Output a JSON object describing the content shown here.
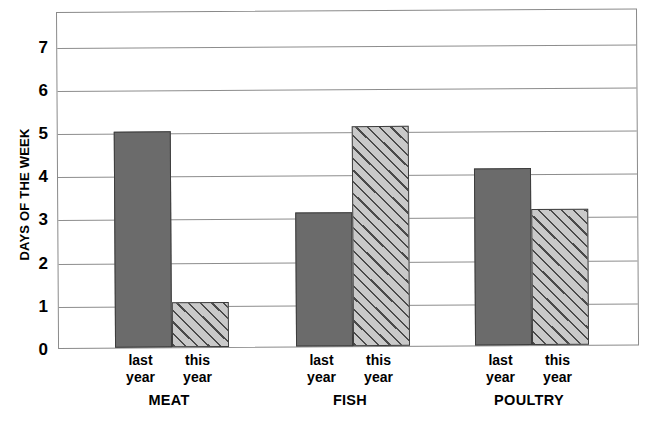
{
  "chart_data": {
    "type": "bar",
    "title": "",
    "subtitle": "",
    "xlabel": "",
    "ylabel": "DAYS OF THE WEEK",
    "ylim": [
      0,
      7.8
    ],
    "yticks": [
      0,
      1,
      2,
      3,
      4,
      5,
      6,
      7
    ],
    "ytick_labels": [
      "0",
      "1",
      "2",
      "3",
      "4",
      "5",
      "6",
      "7"
    ],
    "grid": true,
    "legend": "none",
    "categories": [
      "MEAT",
      "FISH",
      "POULTRY"
    ],
    "series": [
      {
        "name": "last year",
        "style": "solid-gray",
        "color": "#6b6b6b",
        "values": [
          5.0,
          3.1,
          4.1
        ]
      },
      {
        "name": "this year",
        "style": "diagonal-hatch",
        "color": "#c9c9c9",
        "values": [
          1.05,
          5.1,
          3.15
        ]
      }
    ],
    "bars": [
      {
        "group": "MEAT",
        "series": "last year",
        "value": 5.0,
        "fill": "solid"
      },
      {
        "group": "MEAT",
        "series": "this year",
        "value": 1.05,
        "fill": "hatch"
      },
      {
        "group": "FISH",
        "series": "last year",
        "value": 3.1,
        "fill": "solid"
      },
      {
        "group": "FISH",
        "series": "this year",
        "value": 5.1,
        "fill": "hatch"
      },
      {
        "group": "POULTRY",
        "series": "last year",
        "value": 4.1,
        "fill": "solid"
      },
      {
        "group": "POULTRY",
        "series": "this year",
        "value": 3.15,
        "fill": "hatch"
      }
    ]
  },
  "axis": {
    "y_title": "DAYS OF THE WEEK",
    "ticks": [
      {
        "label": "7"
      },
      {
        "label": "6"
      },
      {
        "label": "5"
      },
      {
        "label": "4"
      },
      {
        "label": "3"
      },
      {
        "label": "2"
      },
      {
        "label": "1"
      },
      {
        "label": "0"
      }
    ]
  },
  "x_labels": {
    "pairs": [
      {
        "line1": "last",
        "line2": "year"
      },
      {
        "line1": "this",
        "line2": "year"
      },
      {
        "line1": "last",
        "line2": "year"
      },
      {
        "line1": "this",
        "line2": "year"
      },
      {
        "line1": "last",
        "line2": "year"
      },
      {
        "line1": "this",
        "line2": "year"
      }
    ],
    "groups": [
      {
        "label": "MEAT"
      },
      {
        "label": "FISH"
      },
      {
        "label": "POULTRY"
      }
    ]
  },
  "colors": {
    "solid_bar": "#6b6b6b",
    "hatch_bar_bg": "#c9c9c9",
    "hatch_line": "#4a4a4a",
    "gridline": "#8d8d8d",
    "frame": "#8a8a8a",
    "background": "#ffffff",
    "text": "#000000"
  }
}
